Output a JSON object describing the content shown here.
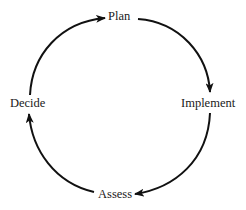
{
  "diagram": {
    "type": "cycle",
    "nodes": [
      {
        "id": "plan",
        "label": "Plan"
      },
      {
        "id": "implement",
        "label": "Implement"
      },
      {
        "id": "assess",
        "label": "Assess"
      },
      {
        "id": "decide",
        "label": "Decide"
      }
    ],
    "edges": [
      {
        "from": "plan",
        "to": "implement"
      },
      {
        "from": "implement",
        "to": "assess"
      },
      {
        "from": "assess",
        "to": "decide"
      },
      {
        "from": "decide",
        "to": "plan"
      }
    ],
    "stroke_color": "#111111"
  }
}
